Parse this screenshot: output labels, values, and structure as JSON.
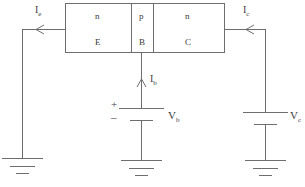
{
  "diagram": {
    "line_color": "#6e6e6e",
    "text_color": "#3a3a3a",
    "background": "#ffffff"
  },
  "transistor": {
    "regions": [
      {
        "doping": "n",
        "terminal": "E"
      },
      {
        "doping": "p",
        "terminal": "B"
      },
      {
        "doping": "n",
        "terminal": "C"
      }
    ]
  },
  "currents": [
    {
      "id": "emitter",
      "label": "I",
      "sub": "e",
      "direction": "left"
    },
    {
      "id": "collector",
      "label": "I",
      "sub": "c",
      "direction": "left"
    },
    {
      "id": "base",
      "label": "I",
      "sub": "b",
      "direction": "up"
    }
  ],
  "sources": [
    {
      "id": "base-battery",
      "label": "V",
      "sub": "b",
      "plus": "+",
      "minus": "–"
    },
    {
      "id": "collector-battery",
      "label": "V",
      "sub": "c",
      "plus": "",
      "minus": ""
    }
  ],
  "grounds": [
    {
      "id": "emitter-ground"
    },
    {
      "id": "base-ground"
    },
    {
      "id": "collector-ground"
    }
  ]
}
